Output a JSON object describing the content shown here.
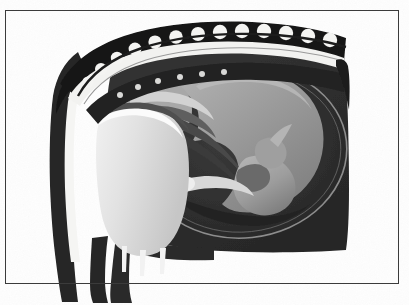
{
  "figure": {
    "name": "sagittal-section-pregnant-uterus",
    "medium": "grayscale medical illustration",
    "alt_text": "Grayscale anatomical line-and-wash drawing showing a side (sagittal) cut through the lower torso of a pregnant female: vertebral column arching across the top, dark uterine body filling the right, a pale gray fetus curled head-down inside the amniotic cavity, and the light gray urinary bladder in front of the uterus at lower left."
  },
  "frame": {
    "border_color": "#3a3a3a",
    "border_width_px": 1,
    "inset_left_px": 5,
    "inset_top_px": 10,
    "inset_right_px": 398,
    "inset_bottom_px": 283,
    "background_color": "#fefefe"
  },
  "palette": {
    "paper_white": "#fefefe",
    "highlight_white": "#f4f4f2",
    "bladder_light": "#dedede",
    "fetus_mid_gray": "#9a9a9a",
    "fetus_shadow_gray": "#6e6e6e",
    "membrane_gray": "#575757",
    "uterine_dark": "#2d2d2d",
    "deep_black": "#1b1b1b",
    "outline_gray": "#4a4a4a"
  },
  "regions": [
    {
      "id": "vertebral-column",
      "label": "Vertebral column (lumbosacral spine)",
      "tone": "deep_black",
      "position": "top arch, left to right"
    },
    {
      "id": "vertebral-bodies",
      "label": "Vertebral bodies (scalloped white segments)",
      "tone": "highlight_white",
      "count": 12,
      "position": "along the top arch"
    },
    {
      "id": "abdominal-wall",
      "label": "Anterior abdominal wall",
      "tone": "deep_black",
      "position": "left vertical band"
    },
    {
      "id": "abdominal-fascia",
      "label": "Abdominal wall fascial layer (white stripe)",
      "tone": "highlight_white",
      "position": "left vertical band, inner"
    },
    {
      "id": "uterus-body",
      "label": "Uterine body / myometrium",
      "tone": "uterine_dark",
      "position": "central and right mass"
    },
    {
      "id": "amniotic-cavity",
      "label": "Amniotic cavity outline",
      "tone": "membrane_gray",
      "position": "oval ring around the fetus"
    },
    {
      "id": "fetus",
      "label": "Fetus in cephalic (head-down) presentation",
      "tone": "fetus_mid_gray",
      "position": "center right, curled"
    },
    {
      "id": "fetal-head",
      "label": "Fetal head",
      "tone": "fetus_mid_gray",
      "position": "lower center of the uterine cavity"
    },
    {
      "id": "fetal-limbs",
      "label": "Fetal limbs",
      "tone": "fetus_shadow_gray",
      "position": "folded across the body"
    },
    {
      "id": "urinary-bladder",
      "label": "Urinary bladder",
      "tone": "bladder_light",
      "position": "lower left, anterior to the uterus"
    },
    {
      "id": "pubic-structures",
      "label": "Pubic / perineal structures",
      "tone": "highlight_white",
      "count": 3,
      "position": "beneath the bladder"
    },
    {
      "id": "thigh-bands",
      "label": "Thigh soft-tissue bands",
      "tone": "deep_black",
      "count": 2,
      "position": "below the frame, lower left"
    }
  ]
}
